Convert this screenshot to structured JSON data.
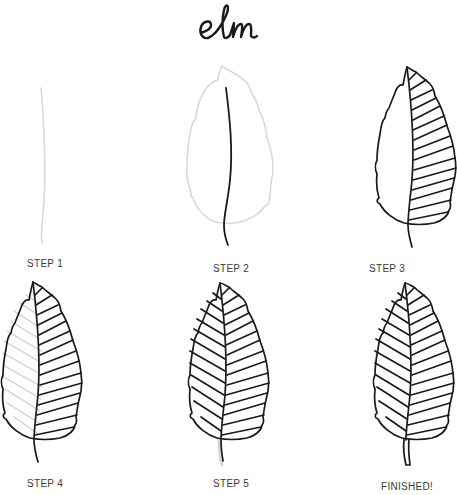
{
  "title": "elm",
  "colors": {
    "ink": "#1a1a1a",
    "guide": "#d8d8d8",
    "guide_hatch": "#cfcfcf",
    "label": "#3a3a3a"
  },
  "steps": [
    {
      "label": "STEP 1"
    },
    {
      "label": "STEP 2"
    },
    {
      "label": "STEP 3"
    },
    {
      "label": "STEP 4"
    },
    {
      "label": "STEP 5"
    },
    {
      "label": "FINISHED!"
    }
  ]
}
